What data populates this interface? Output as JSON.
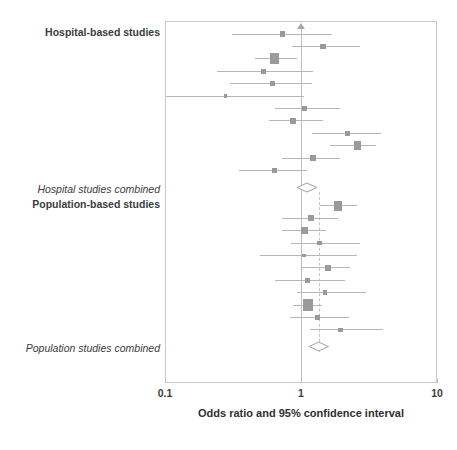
{
  "figure": {
    "type": "forest-plot",
    "axis_caption": "Odds ratio and 95% confidence interval"
  },
  "labels": {
    "hospital_group": "Hospital-based studies",
    "hospital_summary": "Hospital studies combined",
    "population_group": "Population-based studies",
    "population_summary": "Population studies combined"
  },
  "axis": {
    "scale": "log10",
    "min": 0.1,
    "max": 10,
    "ticks": [
      {
        "value": 0.1,
        "label": "0.1"
      },
      {
        "value": 1,
        "label": "1"
      },
      {
        "value": 10,
        "label": "10"
      }
    ],
    "reference_line": 1,
    "null_line_color": "#bdbdbd",
    "pooled_line_color": "#c4c4c4"
  },
  "style": {
    "marker_color": "#9a9a9a",
    "line_color": "#b6b6b6",
    "frame_color": "#c9c9c9",
    "text_color": "#3c3c3c"
  },
  "chart_data": {
    "type": "forest",
    "title": "",
    "xlabel": "Odds ratio and 95% confidence interval",
    "ylabel": "",
    "xscale": "log",
    "xlim": [
      0.1,
      10
    ],
    "grid": false,
    "legend": "none",
    "reference_line": 1.0,
    "groups": [
      {
        "name": "Hospital-based studies",
        "studies": [
          {
            "or": 0.73,
            "lcl": 0.31,
            "ucl": 1.68,
            "weight": 3.0,
            "truncated_high": false
          },
          {
            "or": 1.45,
            "lcl": 0.86,
            "ucl": 2.72,
            "weight": 3.0
          },
          {
            "or": 0.64,
            "lcl": 0.46,
            "ucl": 0.93,
            "weight": 8.5
          },
          {
            "or": 0.53,
            "lcl": 0.24,
            "ucl": 1.22,
            "weight": 2.4
          },
          {
            "or": 0.62,
            "lcl": 0.3,
            "ucl": 1.21,
            "weight": 3.1
          },
          {
            "or": 0.28,
            "lcl": 0.09,
            "ucl": 1.06,
            "weight": 1.1
          },
          {
            "or": 1.06,
            "lcl": 0.64,
            "ucl": 1.92,
            "weight": 2.6
          },
          {
            "or": 0.87,
            "lcl": 0.58,
            "ucl": 1.44,
            "weight": 3.8
          },
          {
            "or": 2.19,
            "lcl": 1.21,
            "ucl": 3.85,
            "weight": 2.6
          },
          {
            "or": 2.6,
            "lcl": 1.64,
            "ucl": 3.56,
            "weight": 6.6
          },
          {
            "or": 1.22,
            "lcl": 0.72,
            "ucl": 1.92,
            "weight": 3.4
          },
          {
            "or": 0.64,
            "lcl": 0.35,
            "ucl": 1.1,
            "weight": 3.2
          }
        ],
        "summary": {
          "label": "Hospital studies combined",
          "or": 1.1,
          "lcl": 0.93,
          "ucl": 1.3
        }
      },
      {
        "name": "Population-based studies",
        "studies": [
          {
            "or": 1.88,
            "lcl": 1.37,
            "ucl": 2.56,
            "weight": 6.2
          },
          {
            "or": 1.18,
            "lcl": 0.73,
            "ucl": 1.88,
            "weight": 3.5
          },
          {
            "or": 1.06,
            "lcl": 0.72,
            "ucl": 1.54,
            "weight": 5.0
          },
          {
            "or": 1.37,
            "lcl": 0.84,
            "ucl": 2.72,
            "weight": 1.9
          },
          {
            "or": 1.05,
            "lcl": 0.5,
            "ucl": 2.6,
            "weight": 1.5
          },
          {
            "or": 1.58,
            "lcl": 1.01,
            "ucl": 2.3,
            "weight": 3.6
          },
          {
            "or": 1.12,
            "lcl": 0.64,
            "ucl": 2.1,
            "weight": 3.0
          },
          {
            "or": 1.5,
            "lcl": 0.93,
            "ucl": 3.0,
            "weight": 1.9
          },
          {
            "or": 1.13,
            "lcl": 0.88,
            "ucl": 1.43,
            "weight": 9.6
          },
          {
            "or": 1.33,
            "lcl": 0.83,
            "ucl": 2.24,
            "weight": 2.9
          },
          {
            "or": 1.95,
            "lcl": 1.16,
            "ucl": 4.0,
            "weight": 2.1
          }
        ],
        "summary": {
          "label": "Population studies combined",
          "or": 1.36,
          "lcl": 1.15,
          "ucl": 1.6
        }
      }
    ]
  }
}
